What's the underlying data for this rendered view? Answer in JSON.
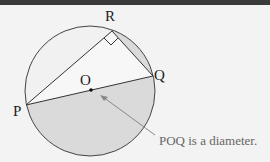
{
  "diagram": {
    "points": {
      "R": "R",
      "Q": "Q",
      "O": "O",
      "P": "P"
    },
    "annotation": "POQ is a diameter.",
    "colors": {
      "background": "#f3f3f3",
      "shaded_region": "#d9d9d9",
      "light_region": "#f6f6f6",
      "lines": "#333333",
      "arrow": "#888888"
    }
  }
}
